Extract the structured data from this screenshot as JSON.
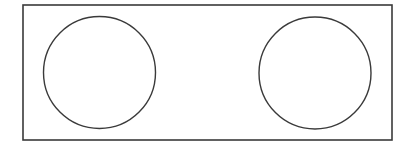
{
  "canvas": {
    "width": 416,
    "height": 146,
    "background": "#ffffff"
  },
  "stroke_color": "#3a3a3a",
  "frame": {
    "x": 23,
    "y": 5,
    "width": 369,
    "height": 135,
    "stroke_width": 1.6
  },
  "circles": [
    {
      "name": "left-circle",
      "cx": 99.5,
      "cy": 72.5,
      "r": 56,
      "stroke_width": 1.4
    },
    {
      "name": "right-circle",
      "cx": 315,
      "cy": 73,
      "r": 56,
      "stroke_width": 1.4
    }
  ]
}
